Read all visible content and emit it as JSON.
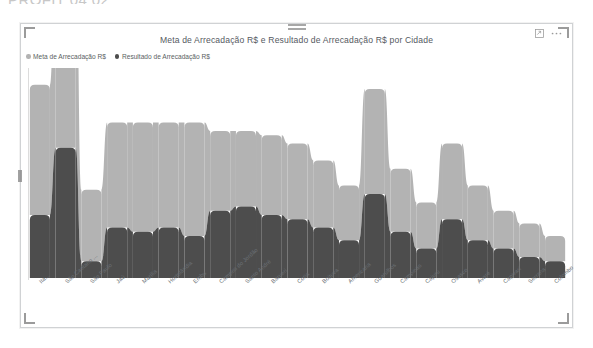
{
  "page": {
    "heading_partial": "PROFIT 04 02"
  },
  "visual": {
    "title": "Meta de Arrecadação R$ e Resultado de Arrecadação R$ por Cidade",
    "header_icons": [
      {
        "name": "focus-mode-icon",
        "label": "Modo de foco"
      },
      {
        "name": "more-options-icon",
        "label": "Mais opções"
      }
    ]
  },
  "legend": {
    "position": "top-left",
    "items": [
      {
        "label": "Meta de Arrecadação R$",
        "color": "#b3b3b3"
      },
      {
        "label": "Resultado de Arrecadação R$",
        "color": "#4d4d4d"
      }
    ]
  },
  "chart_data": {
    "type": "bar",
    "subtype": "ribbon-stacked",
    "title": "Meta de Arrecadação R$ e Resultado de Arrecadação R$ por Cidade",
    "xlabel": "Cidade",
    "ylabel": "",
    "grid": false,
    "legend_position": "top-left",
    "ylim": [
      0,
      100
    ],
    "categories": [
      "Ita...",
      "São Caetano ...",
      "São Paulo",
      "Jaú",
      "Marília",
      "Hortolândia",
      "Embu",
      "Campos do Jordão",
      "Santo André",
      "Barueri",
      "Cotia",
      "Boituva",
      "Americana",
      "Guarulhos",
      "Campinas",
      "Cajuru",
      "Osasco",
      "Avaré",
      "Capivari",
      "Serrana",
      "Colombo"
    ],
    "series": [
      {
        "name": "Meta de Arrecadação R$",
        "color": "#b3b3b3",
        "values": [
          62,
          96,
          34,
          50,
          52,
          50,
          54,
          38,
          36,
          38,
          36,
          32,
          26,
          50,
          30,
          22,
          36,
          26,
          18,
          16,
          12
        ]
      },
      {
        "name": "Resultado de Arrecadação R$",
        "color": "#4d4d4d",
        "values": [
          30,
          62,
          8,
          24,
          22,
          24,
          20,
          32,
          34,
          30,
          28,
          24,
          18,
          40,
          22,
          14,
          28,
          18,
          14,
          10,
          8
        ]
      }
    ]
  }
}
